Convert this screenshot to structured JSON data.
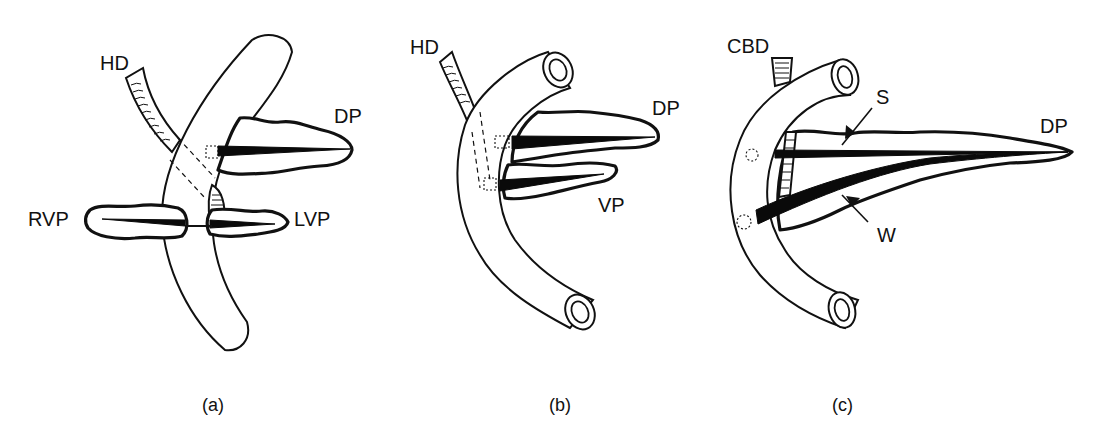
{
  "figure": {
    "panels": [
      {
        "id": "a",
        "caption": "(a)",
        "labels": {
          "hepatic_duct": "HD",
          "dorsal_pancreas": "DP",
          "right_ventral_pancreas": "RVP",
          "left_ventral_pancreas": "LVP"
        }
      },
      {
        "id": "b",
        "caption": "(b)",
        "labels": {
          "hepatic_duct": "HD",
          "dorsal_pancreas": "DP",
          "ventral_pancreas": "VP"
        }
      },
      {
        "id": "c",
        "caption": "(c)",
        "labels": {
          "common_bile_duct": "CBD",
          "santorini_duct": "S",
          "dorsal_pancreas": "DP",
          "wirsung_duct": "W"
        }
      }
    ],
    "colors": {
      "ink": "#111111",
      "background": "#ffffff"
    }
  }
}
